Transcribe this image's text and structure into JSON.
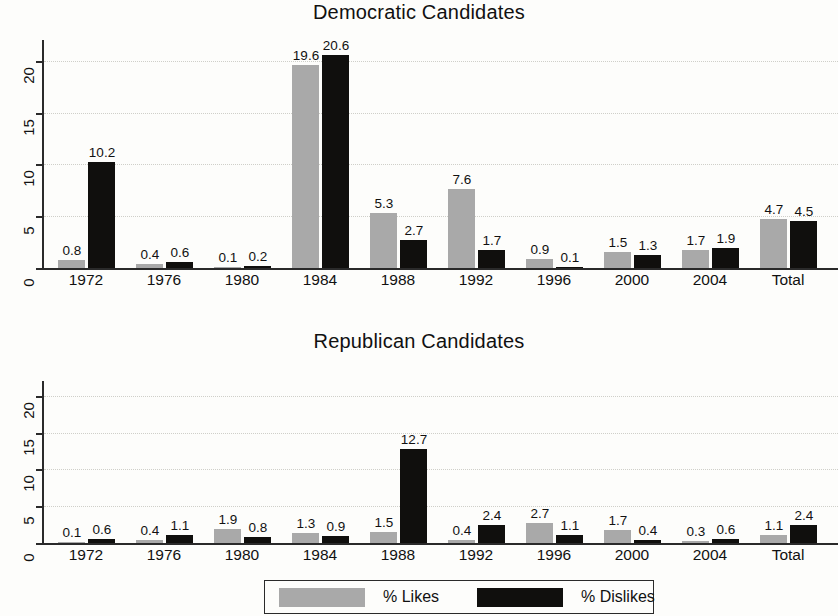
{
  "legend": {
    "likes_label": "% Likes",
    "dislikes_label": "% Dislikes",
    "likes_color": "#a9a9a9",
    "dislikes_color": "#100f0d"
  },
  "axis": {
    "ticks": [
      "0",
      "5",
      "10",
      "15",
      "20"
    ]
  },
  "chart_data": [
    {
      "type": "bar",
      "title": "Democratic Candidates",
      "xlabel": "",
      "ylabel": "",
      "ylim": [
        0,
        22
      ],
      "yticks": [
        0,
        5,
        10,
        15,
        20
      ],
      "grid": true,
      "legend_position": "bottom",
      "categories": [
        "1972",
        "1976",
        "1980",
        "1984",
        "1988",
        "1992",
        "1996",
        "2000",
        "2004",
        "Total"
      ],
      "series": [
        {
          "name": "% Likes",
          "color": "#a9a9a9",
          "values": [
            0.8,
            0.4,
            0.1,
            19.6,
            5.3,
            7.6,
            0.9,
            1.5,
            1.7,
            4.7
          ]
        },
        {
          "name": "% Dislikes",
          "color": "#100f0d",
          "values": [
            10.2,
            0.6,
            0.2,
            20.6,
            2.7,
            1.7,
            0.1,
            1.3,
            1.9,
            4.5
          ]
        }
      ],
      "labels": {
        "likes": [
          "0.8",
          "0.4",
          "0.1",
          "19.6",
          "5.3",
          "7.6",
          "0.9",
          "1.5",
          "1.7",
          "4.7"
        ],
        "dislikes": [
          "10.2",
          "0.6",
          "0.2",
          "20.6",
          "2.7",
          "1.7",
          "0.1",
          "1.3",
          "1.9",
          "4.5"
        ]
      }
    },
    {
      "type": "bar",
      "title": "Republican Candidates",
      "xlabel": "",
      "ylabel": "",
      "ylim": [
        0,
        22
      ],
      "yticks": [
        0,
        5,
        10,
        15,
        20
      ],
      "grid": true,
      "legend_position": "bottom",
      "categories": [
        "1972",
        "1976",
        "1980",
        "1984",
        "1988",
        "1992",
        "1996",
        "2000",
        "2004",
        "Total"
      ],
      "series": [
        {
          "name": "% Likes",
          "color": "#a9a9a9",
          "values": [
            0.1,
            0.4,
            1.9,
            1.3,
            1.5,
            0.4,
            2.7,
            1.7,
            0.3,
            1.1
          ]
        },
        {
          "name": "% Dislikes",
          "color": "#100f0d",
          "values": [
            0.6,
            1.1,
            0.8,
            0.9,
            12.7,
            2.4,
            1.1,
            0.4,
            0.6,
            2.4
          ]
        }
      ],
      "labels": {
        "likes": [
          "0.1",
          "0.4",
          "1.9",
          "1.3",
          "1.5",
          "0.4",
          "2.7",
          "1.7",
          "0.3",
          "1.1"
        ],
        "dislikes": [
          "0.6",
          "1.1",
          "0.8",
          "0.9",
          "12.7",
          "2.4",
          "1.1",
          "0.4",
          "0.6",
          "2.4"
        ]
      }
    }
  ]
}
